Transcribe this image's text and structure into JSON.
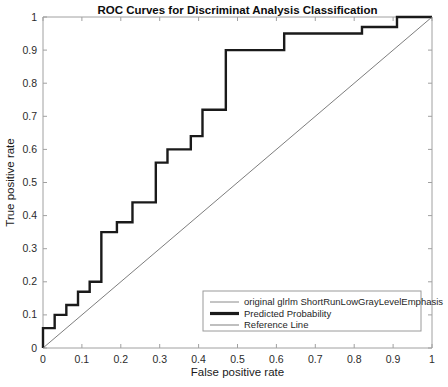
{
  "chart_data": {
    "type": "line",
    "title": "ROC Curves for Discriminat Analysis Classification",
    "xlabel": "False positive rate",
    "ylabel": "True positive rate",
    "xlim": [
      0,
      1
    ],
    "ylim": [
      0,
      1
    ],
    "grid": false,
    "legend_position": "lower right",
    "xticks": [
      "0",
      "0.1",
      "0.2",
      "0.3",
      "0.4",
      "0.5",
      "0.6",
      "0.7",
      "0.8",
      "0.9",
      "1"
    ],
    "yticks": [
      "0",
      "0.1",
      "0.2",
      "0.3",
      "0.4",
      "0.5",
      "0.6",
      "0.7",
      "0.8",
      "0.9",
      "1"
    ],
    "xtick_values": [
      0,
      0.1,
      0.2,
      0.3,
      0.4,
      0.5,
      0.6,
      0.7,
      0.8,
      0.9,
      1
    ],
    "ytick_values": [
      0,
      0.1,
      0.2,
      0.3,
      0.4,
      0.5,
      0.6,
      0.7,
      0.8,
      0.9,
      1
    ],
    "series": [
      {
        "name": "original glrlm ShortRunLowGrayLevelEmphasis",
        "style": "thin-line",
        "color": "#4d4d4d",
        "width": 0.8,
        "points": []
      },
      {
        "name": "Predicted Probability",
        "style": "step-line",
        "color": "#1a1a1a",
        "width": 2.4,
        "points": [
          [
            0.0,
            0.0
          ],
          [
            0.0,
            0.06
          ],
          [
            0.03,
            0.06
          ],
          [
            0.03,
            0.1
          ],
          [
            0.06,
            0.1
          ],
          [
            0.06,
            0.13
          ],
          [
            0.09,
            0.13
          ],
          [
            0.09,
            0.17
          ],
          [
            0.12,
            0.17
          ],
          [
            0.12,
            0.2
          ],
          [
            0.15,
            0.2
          ],
          [
            0.15,
            0.35
          ],
          [
            0.19,
            0.35
          ],
          [
            0.19,
            0.38
          ],
          [
            0.23,
            0.38
          ],
          [
            0.23,
            0.44
          ],
          [
            0.29,
            0.44
          ],
          [
            0.29,
            0.56
          ],
          [
            0.32,
            0.56
          ],
          [
            0.32,
            0.6
          ],
          [
            0.38,
            0.6
          ],
          [
            0.38,
            0.64
          ],
          [
            0.41,
            0.64
          ],
          [
            0.41,
            0.72
          ],
          [
            0.47,
            0.72
          ],
          [
            0.47,
            0.9
          ],
          [
            0.62,
            0.9
          ],
          [
            0.62,
            0.95
          ],
          [
            0.82,
            0.95
          ],
          [
            0.82,
            0.97
          ],
          [
            0.91,
            0.97
          ],
          [
            0.91,
            1.0
          ],
          [
            1.0,
            1.0
          ]
        ]
      },
      {
        "name": "Reference Line",
        "style": "diagonal",
        "color": "#6e6e6e",
        "width": 0.9,
        "points": [
          [
            0,
            0
          ],
          [
            1,
            1
          ]
        ]
      }
    ]
  },
  "legend": {
    "entries": [
      {
        "label": "original glrlm ShortRunLowGrayLevelEmphasis",
        "color": "#8a8a8a",
        "thickness": 1
      },
      {
        "label": "Predicted Probability",
        "color": "#1a1a1a",
        "thickness": 3.2
      },
      {
        "label": "Reference Line",
        "color": "#8a8a8a",
        "thickness": 1.1
      }
    ]
  },
  "colors": {
    "axis": "#a0a0a0",
    "text": "#2b2b2b",
    "background": "#ffffff",
    "legend_border": "#9a9a9a"
  }
}
